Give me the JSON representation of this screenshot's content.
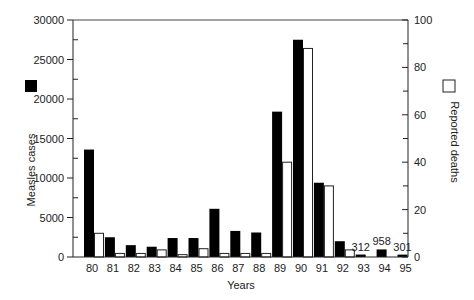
{
  "chart_data": {
    "type": "bar",
    "title": "",
    "xlabel": "Years",
    "ylabel": "Measles cases",
    "y2label": "Reported deaths",
    "categories": [
      "80",
      "81",
      "82",
      "83",
      "84",
      "85",
      "86",
      "87",
      "88",
      "89",
      "90",
      "91",
      "92",
      "93",
      "94",
      "95"
    ],
    "series": [
      {
        "name": "Measles cases",
        "axis": "left",
        "color": "#000000",
        "values": [
          13600,
          2500,
          1500,
          1300,
          2400,
          2400,
          6100,
          3300,
          3100,
          18400,
          27500,
          9400,
          2000,
          312,
          958,
          301
        ]
      },
      {
        "name": "Reported deaths",
        "axis": "right",
        "color": "#ffffff",
        "values": [
          10,
          1.5,
          1.5,
          3,
          1,
          3.5,
          1.5,
          1.5,
          1.5,
          40,
          88,
          30,
          3,
          0,
          0,
          0
        ]
      }
    ],
    "ylim": [
      0,
      30000
    ],
    "y2lim": [
      0,
      100
    ],
    "yticks": [
      0,
      5000,
      10000,
      15000,
      20000,
      25000,
      30000
    ],
    "y2ticks": [
      0,
      20,
      40,
      60,
      80,
      100
    ],
    "annotations": [
      {
        "category": "93",
        "text": "312"
      },
      {
        "category": "94",
        "text": "958"
      },
      {
        "category": "95",
        "text": "301"
      }
    ],
    "legend": [
      {
        "label": "Measles cases",
        "style": "filled-black-square",
        "position": "left"
      },
      {
        "label": "Reported deaths",
        "style": "open-square",
        "position": "right"
      }
    ],
    "grid": false
  }
}
